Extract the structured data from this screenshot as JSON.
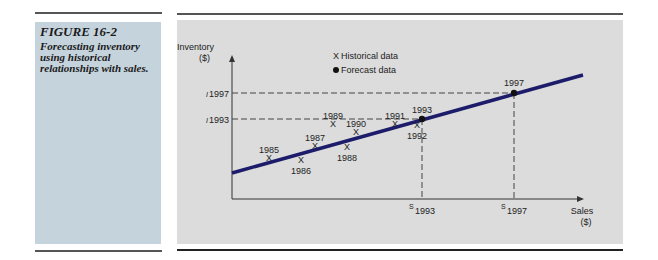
{
  "caption": {
    "figure_label": "FIGURE 16-2",
    "text": "Forecasting inventory using historical relationships with sales."
  },
  "chart_data": {
    "type": "scatter",
    "title": "Forecasting inventory using historical relationships with sales.",
    "ylabel": "Inventory ($)",
    "xlabel": "Sales ($)",
    "y_label_lines": [
      "Inventory",
      "($)"
    ],
    "x_label_lines": [
      "Sales",
      "($)"
    ],
    "legend": [
      {
        "symbol": "X",
        "label": "Historical data"
      },
      {
        "symbol": "●",
        "label": "Forecast data"
      }
    ],
    "regression_line": {
      "color": "#1c1c6b",
      "description": "Fitted line through historical data"
    },
    "series": [
      {
        "name": "Historical data",
        "marker": "X",
        "points": [
          {
            "label": "1985",
            "x": 269,
            "y": 158,
            "label_pos": "above"
          },
          {
            "label": "1986",
            "x": 301,
            "y": 160,
            "label_pos": "below"
          },
          {
            "label": "1987",
            "x": 315,
            "y": 146,
            "label_pos": "above"
          },
          {
            "label": "1988",
            "x": 347,
            "y": 147,
            "label_pos": "below"
          },
          {
            "label": "1989",
            "x": 333,
            "y": 124,
            "label_pos": "above"
          },
          {
            "label": "1990",
            "x": 356,
            "y": 132,
            "label_pos": "above"
          },
          {
            "label": "1991",
            "x": 395,
            "y": 124,
            "label_pos": "above"
          },
          {
            "label": "1992",
            "x": 417,
            "y": 125,
            "label_pos": "below"
          }
        ]
      },
      {
        "name": "Forecast data",
        "marker": "dot",
        "points": [
          {
            "label": "1993",
            "x": 422,
            "y": 119
          },
          {
            "label": "1997",
            "x": 514,
            "y": 93
          }
        ]
      }
    ],
    "y_ticks": [
      {
        "prefix": "I",
        "label": "1993"
      },
      {
        "prefix": "I",
        "label": "1997"
      }
    ],
    "x_ticks": [
      {
        "prefix": "S",
        "label": "1993"
      },
      {
        "prefix": "S",
        "label": "1997"
      }
    ],
    "note": "Point coordinates are pixel positions; axes have no numeric scale."
  }
}
